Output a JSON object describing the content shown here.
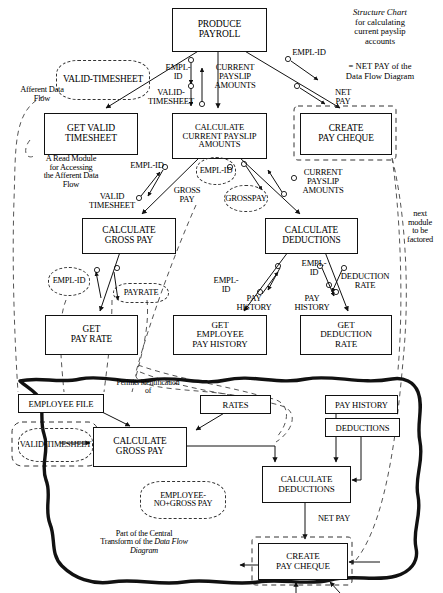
{
  "diagram": {
    "kind": "structure-chart",
    "caption_title": "Structure Chart",
    "caption_lines": "for calculating\ncurrent payslip\naccounts",
    "caption_netpay": "= NET PAY of the\nData Flow Diagram",
    "bg_color": "#ffffff",
    "line_color": "#111111"
  },
  "modules": [
    {
      "id": "produce-payroll",
      "label": "PRODUCE\nPAYROLL",
      "x": 172,
      "y": 8,
      "w": 93,
      "h": 42,
      "fs": 9.5
    },
    {
      "id": "get-valid-timesheet",
      "label": "GET VALID\nTIMESHEET",
      "x": 44,
      "y": 113,
      "w": 92,
      "h": 40,
      "fs": 9.5
    },
    {
      "id": "calc-current-payslip",
      "label": "CALCULATE\nCURRENT PAYSLIP\nAMOUNTS",
      "x": 172,
      "y": 113,
      "w": 93,
      "h": 44,
      "fs": 8.6
    },
    {
      "id": "create-pay-cheque-sc",
      "label": "CREATE\nPAY CHEQUE",
      "x": 300,
      "y": 113,
      "w": 90,
      "h": 40,
      "fs": 9.3
    },
    {
      "id": "calc-gross-pay-sc",
      "label": "CALCULATE\nGROSS PAY",
      "x": 82,
      "y": 218,
      "w": 92,
      "h": 34,
      "fs": 9.3
    },
    {
      "id": "calc-deductions-sc",
      "label": "CALCULATE\nDEDUCTIONS",
      "x": 265,
      "y": 218,
      "w": 91,
      "h": 34,
      "fs": 9.3
    },
    {
      "id": "get-pay-rate",
      "label": "GET\nPAY RATE",
      "x": 45,
      "y": 315,
      "w": 91,
      "h": 38,
      "fs": 9.3
    },
    {
      "id": "get-employee-pay-history",
      "label": "GET\nEMPLOYEE\nPAY HISTORY",
      "x": 173,
      "y": 315,
      "w": 92,
      "h": 38,
      "fs": 9.0
    },
    {
      "id": "get-deduction-rate",
      "label": "GET\nDEDUCTION\nRATE",
      "x": 300,
      "y": 315,
      "w": 90,
      "h": 38,
      "fs": 9.0
    },
    {
      "id": "calc-gross-pay-dfd",
      "label": "CALCULATE\nGROSS PAY",
      "x": 93,
      "y": 427,
      "w": 92,
      "h": 38,
      "fs": 9.3
    },
    {
      "id": "calc-deductions-dfd",
      "label": "CALCULATE\nDEDUCTIONS",
      "x": 262,
      "y": 466,
      "w": 87,
      "h": 35,
      "fs": 9.0
    },
    {
      "id": "create-pay-cheque-dfd",
      "label": "CREATE\nPAY CHEQUE",
      "x": 258,
      "y": 543,
      "w": 88,
      "h": 35,
      "fs": 9.0
    }
  ],
  "stores": [
    {
      "id": "employee-file",
      "label": "EMPLOYEE FILE",
      "x": 18,
      "y": 394,
      "w": 84,
      "h": 17,
      "fs": 8.6
    },
    {
      "id": "rates",
      "label": "RATES",
      "x": 200,
      "y": 395,
      "w": 69,
      "h": 17,
      "fs": 8.6
    },
    {
      "id": "pay-history",
      "label": "PAY HISTORY",
      "x": 325,
      "y": 395,
      "w": 71,
      "h": 17,
      "fs": 8.6
    },
    {
      "id": "deductions",
      "label": "DEDUCTIONS",
      "x": 325,
      "y": 418,
      "w": 73,
      "h": 17,
      "fs": 8.6
    }
  ],
  "clouds": [
    {
      "id": "valid-timesheet-top",
      "label": "VALID-\nTIMESHEET",
      "x": 56,
      "y": 60,
      "w": 92,
      "h": 38,
      "fs": 9.4
    },
    {
      "id": "empl-id-mid",
      "label": "EMPL-\nID",
      "x": 196,
      "y": 157,
      "w": 38,
      "h": 26,
      "fs": 8.4
    },
    {
      "id": "gross-pay-cloud",
      "label": "GROSS\nPAY",
      "x": 224,
      "y": 185,
      "w": 42,
      "h": 25,
      "fs": 8.6
    },
    {
      "id": "empl-id-left",
      "label": "EMPL-\nID",
      "x": 48,
      "y": 267,
      "w": 40,
      "h": 27,
      "fs": 8.4
    },
    {
      "id": "payrate-cloud",
      "label": "PAYRATE",
      "x": 113,
      "y": 283,
      "w": 54,
      "h": 18,
      "fs": 8.4
    },
    {
      "id": "valid-timesheet-dfd",
      "label": "VALID-\nTIMESHEET",
      "x": 18,
      "y": 428,
      "w": 73,
      "h": 32,
      "fs": 8.4
    },
    {
      "id": "employee-no-gross",
      "label": "EMPLOYEE-NO\n+\nGROSS PAY",
      "x": 140,
      "y": 481,
      "w": 84,
      "h": 36,
      "fs": 8.4
    }
  ],
  "labels": [
    {
      "id": "afferent-data-flow",
      "text": "Afferent Data\nFlow",
      "x": 2,
      "y": 86,
      "w": 80,
      "fs": 8.4,
      "italic": false
    },
    {
      "id": "empl-id-top",
      "text": "EMPL-\nID",
      "x": 160,
      "y": 63,
      "w": 36,
      "fs": 8.6,
      "italic": false
    },
    {
      "id": "valid-timesheet-lbl",
      "text": "VALID-\nTIMESHEET",
      "x": 136,
      "y": 88,
      "w": 70,
      "fs": 8.6,
      "italic": false
    },
    {
      "id": "current-payslip-amounts-top",
      "text": "CURRENT\nPAYSLIP\nAMOUNTS",
      "x": 203,
      "y": 63,
      "w": 64,
      "fs": 8.6,
      "italic": false
    },
    {
      "id": "empl-id-right",
      "text": "EMPL-ID",
      "x": 284,
      "y": 48,
      "w": 50,
      "fs": 8.6,
      "italic": false
    },
    {
      "id": "net-pay-top",
      "text": "NET\nPAY",
      "x": 326,
      "y": 88,
      "w": 34,
      "fs": 8.6,
      "italic": false
    },
    {
      "id": "read-module-note",
      "text": "A Read Module\nfor Accessing\nthe Afferent Data\nFlow",
      "x": 22,
      "y": 155,
      "w": 98,
      "fs": 8.4,
      "italic": false
    },
    {
      "id": "empl-id-b",
      "text": "EMPL-ID",
      "x": 122,
      "y": 161,
      "w": 50,
      "fs": 8.6,
      "italic": false
    },
    {
      "id": "valid-timesheet-c",
      "text": "VALID\nTIMESHEET",
      "x": 76,
      "y": 192,
      "w": 72,
      "fs": 8.6,
      "italic": false
    },
    {
      "id": "gross-pay-lbl",
      "text": "GROSS\nPAY",
      "x": 166,
      "y": 186,
      "w": 42,
      "fs": 8.6,
      "italic": false
    },
    {
      "id": "current-payslip-amounts-mid",
      "text": "CURRENT\nPAYSLIP\nAMOUNTS",
      "x": 292,
      "y": 168,
      "w": 62,
      "fs": 8.6,
      "italic": false
    },
    {
      "id": "next-module-note",
      "text": "next\nmodule\nto be\nfactored",
      "x": 398,
      "y": 210,
      "w": 44,
      "fs": 8.4,
      "italic": false
    },
    {
      "id": "empl-id-c",
      "text": "EMPL-\nID",
      "x": 208,
      "y": 276,
      "w": 36,
      "fs": 8.6,
      "italic": false
    },
    {
      "id": "pay-history-a",
      "text": "PAY\nHISTORY",
      "x": 228,
      "y": 294,
      "w": 52,
      "fs": 8.6,
      "italic": false
    },
    {
      "id": "empl-id-d",
      "text": "EMPL-\nID",
      "x": 296,
      "y": 259,
      "w": 36,
      "fs": 8.6,
      "italic": false
    },
    {
      "id": "pay-history-b",
      "text": "PAY\nHISTORY",
      "x": 286,
      "y": 294,
      "w": 52,
      "fs": 8.6,
      "italic": false
    },
    {
      "id": "deduction-rate",
      "text": "DEDUCTION\nRATE",
      "x": 332,
      "y": 272,
      "w": 66,
      "fs": 8.6,
      "italic": false
    },
    {
      "id": "permits-identification",
      "text": "Permits identification\nof",
      "x": 100,
      "y": 379,
      "w": 96,
      "fs": 7.8,
      "italic": false
    },
    {
      "id": "net-pay-dfd",
      "text": "NET PAY",
      "x": 310,
      "y": 515,
      "w": 48,
      "fs": 8.4,
      "italic": false
    }
  ],
  "central_transform_note": {
    "id": "central-transform-note",
    "line1": "Part of the Central",
    "line2a": "Transform of the ",
    "line2b": "Data Flow",
    "line3": "Diagram",
    "x": 74,
    "y": 530,
    "w": 140,
    "fs": 8.2
  }
}
